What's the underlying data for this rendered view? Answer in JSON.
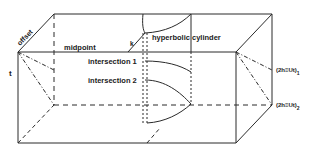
{
  "diagram": {
    "type": "3d-box-geometry",
    "colors": {
      "line": "#2a2a2a",
      "background": "#ffffff"
    },
    "labels": {
      "offset": "offset",
      "midpoint": "midpoint",
      "k": "k",
      "t": "t",
      "hyperbolic_cylinder": "hyperbolic cylinder",
      "intersection_1": "intersection 1",
      "intersection_2": "intersection 2",
      "plane_1": "(2h≡Ut)",
      "plane_1_sub": "1",
      "plane_2": "(2h≡Ut)",
      "plane_2_sub": "2"
    }
  }
}
